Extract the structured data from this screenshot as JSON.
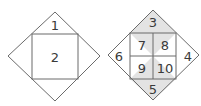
{
  "figures": [
    {
      "name": "left",
      "labels": {
        "top_triangle": "1",
        "square": "2"
      }
    },
    {
      "name": "right",
      "labels": {
        "top_triangle": "3",
        "right_triangle": "4",
        "bottom_triangle": "5",
        "left_triangle": "6",
        "cell_top_left": "7",
        "cell_top_right": "8",
        "cell_bottom_left": "9",
        "cell_bottom_right": "10"
      },
      "shaded_regions": [
        "top_triangle",
        "bottom_triangle",
        "inner_top_hourglass",
        "inner_bottom_hourglass"
      ],
      "shade_color": "#e3e3e3"
    }
  ],
  "colors": {
    "line": "#6b6b6b",
    "text": "#3a3a3a",
    "background": "#ffffff"
  }
}
